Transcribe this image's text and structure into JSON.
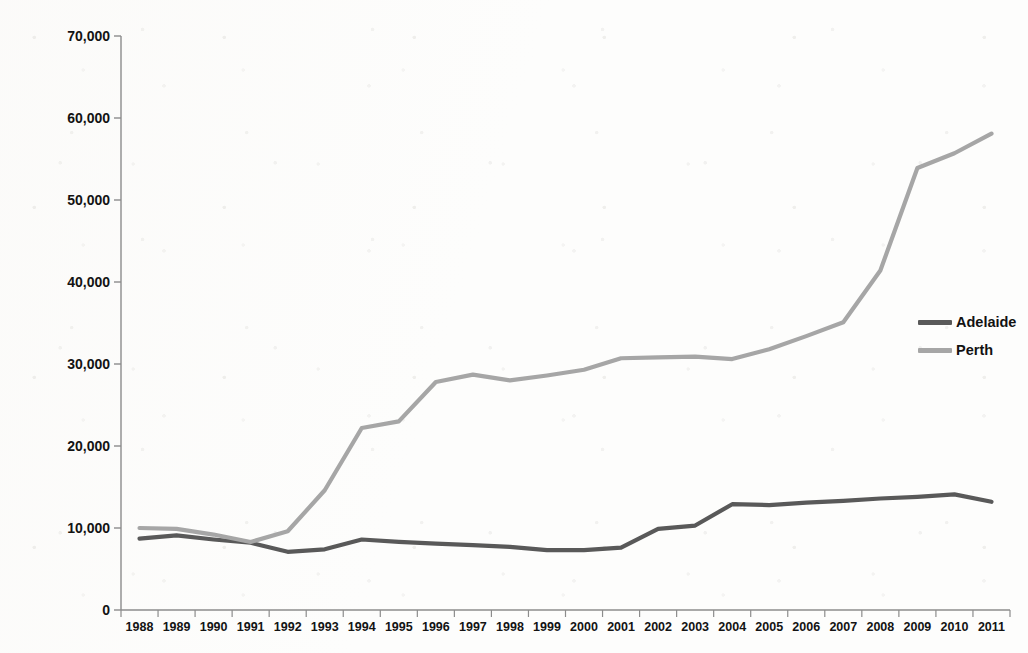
{
  "chart_data": {
    "type": "line",
    "title": "",
    "xlabel": "",
    "ylabel": "Annual Rail Boardings (in thousands: Train and Tram)",
    "categories": [
      "1988",
      "1989",
      "1990",
      "1991",
      "1992",
      "1993",
      "1994",
      "1995",
      "1996",
      "1997",
      "1998",
      "1999",
      "2000",
      "2001",
      "2002",
      "2003",
      "2004",
      "2005",
      "2006",
      "2007",
      "2008",
      "2009",
      "2010",
      "2011"
    ],
    "ylim": [
      0,
      70000
    ],
    "ytick_values": [
      0,
      10000,
      20000,
      30000,
      40000,
      50000,
      60000,
      70000
    ],
    "ytick_labels": [
      "0",
      "10,000",
      "20,000",
      "30,000",
      "40,000",
      "50,000",
      "60,000",
      "70,000"
    ],
    "grid": false,
    "legend_position": "right",
    "series": [
      {
        "name": "Adelaide",
        "color": "#595959",
        "values": [
          8700,
          9100,
          8600,
          8200,
          7100,
          7400,
          8600,
          8300,
          8100,
          7900,
          7700,
          7300,
          7300,
          7600,
          9900,
          10300,
          12900,
          12800,
          13100,
          13300,
          13600,
          13800,
          14100,
          13200
        ]
      },
      {
        "name": "Perth",
        "color": "#a6a6a6",
        "values": [
          10000,
          9900,
          9200,
          8300,
          9600,
          14600,
          22200,
          23000,
          27800,
          28700,
          28000,
          28600,
          29300,
          30700,
          30800,
          30900,
          30600,
          31800,
          33400,
          35100,
          41400,
          53900,
          55700,
          58100
        ]
      }
    ]
  },
  "legend": {
    "items": [
      {
        "label": "Adelaide",
        "color": "#595959"
      },
      {
        "label": "Perth",
        "color": "#a6a6a6"
      }
    ]
  },
  "axes": {
    "y_axis_title": "Annual Rail Boardings (in thousands: Train and Tram)"
  }
}
